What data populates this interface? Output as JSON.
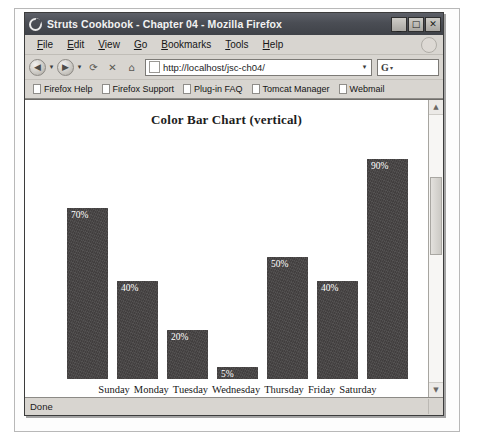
{
  "window": {
    "title": "Struts Cookbook - Chapter 04 - Mozilla Firefox",
    "app_icon": "firefox-icon",
    "controls": {
      "minimize": "_",
      "maximize": "□",
      "close": "✕"
    }
  },
  "menubar": {
    "items": [
      {
        "label": "File",
        "mnemonic": "F"
      },
      {
        "label": "Edit",
        "mnemonic": "E"
      },
      {
        "label": "View",
        "mnemonic": "V"
      },
      {
        "label": "Go",
        "mnemonic": "G"
      },
      {
        "label": "Bookmarks",
        "mnemonic": "B"
      },
      {
        "label": "Tools",
        "mnemonic": "T"
      },
      {
        "label": "Help",
        "mnemonic": "H"
      }
    ]
  },
  "toolbar": {
    "back_icon": "back-arrow-icon",
    "forward_icon": "forward-arrow-icon",
    "reload_icon": "reload-icon",
    "stop_icon": "stop-icon",
    "home_icon": "home-icon",
    "dropdown_caret": "▾",
    "address": {
      "value": "http://localhost/jsc-ch04/",
      "placeholder": "Enter address",
      "favicon": "page-icon",
      "dropdown_caret": "▾"
    },
    "search": {
      "engine_label": "G",
      "value": "",
      "placeholder": "Search",
      "dropdown_caret": "▾"
    }
  },
  "bookmarks": {
    "items": [
      {
        "label": "Firefox Help",
        "icon": "bookmark-page-icon"
      },
      {
        "label": "Firefox Support",
        "icon": "bookmark-page-icon"
      },
      {
        "label": "Plug-in FAQ",
        "icon": "bookmark-page-icon"
      },
      {
        "label": "Tomcat Manager",
        "icon": "bookmark-page-icon"
      },
      {
        "label": "Webmail",
        "icon": "bookmark-page-icon"
      }
    ]
  },
  "page": {
    "title": "Color Bar Chart (vertical)"
  },
  "scrollbar": {
    "up_arrow": "▲",
    "down_arrow": "▼"
  },
  "statusbar": {
    "text": "Done"
  },
  "chart_data": {
    "type": "bar",
    "title": "Color Bar Chart (vertical)",
    "categories": [
      "Sunday",
      "Monday",
      "Tuesday",
      "Wednesday",
      "Thursday",
      "Friday",
      "Saturday"
    ],
    "values": [
      70,
      40,
      20,
      5,
      50,
      40,
      90
    ],
    "labels": [
      "70%",
      "40%",
      "20%",
      "5%",
      "50%",
      "40%",
      "90%"
    ],
    "xlabel": "",
    "ylabel": "",
    "ylim": [
      0,
      100
    ],
    "grid": false,
    "legend": "none",
    "bar_color": "#474444",
    "label_color": "#ffffff",
    "orientation": "vertical"
  }
}
